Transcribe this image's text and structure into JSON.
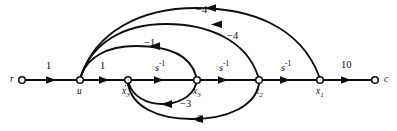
{
  "figure": {
    "type": "signal-flow-graph",
    "title": "",
    "background": "#ffffff",
    "ink_color": "#0d0d0d"
  },
  "nodes": [
    {
      "id": "r",
      "label": "r",
      "sub": "",
      "dot": false,
      "x": 22,
      "y": 80,
      "label_side": "left"
    },
    {
      "id": "u",
      "label": "u",
      "sub": "",
      "dot": false,
      "x": 80,
      "y": 80,
      "label_side": "below"
    },
    {
      "id": "xd3",
      "label": "x",
      "sub": "3",
      "dot": true,
      "x": 128,
      "y": 80,
      "label_side": "below"
    },
    {
      "id": "x3",
      "label": "x",
      "sub": "3",
      "dot": false,
      "x": 197,
      "y": 80,
      "label_side": "below"
    },
    {
      "id": "x2",
      "label": "x",
      "sub": "2",
      "dot": false,
      "x": 259,
      "y": 80,
      "label_side": "below"
    },
    {
      "id": "x1",
      "label": "x",
      "sub": "1",
      "dot": false,
      "x": 320,
      "y": 80,
      "label_side": "below"
    },
    {
      "id": "c",
      "label": "c",
      "sub": "",
      "dot": false,
      "x": 375,
      "y": 80,
      "label_side": "right"
    }
  ],
  "edges": [
    {
      "id": "e-r-u",
      "from": "r",
      "to": "u",
      "gain": "1",
      "kind": "forward",
      "label_x": 46,
      "label_y": 61
    },
    {
      "id": "e-u-xd3",
      "from": "u",
      "to": "xd3",
      "gain": "1",
      "kind": "forward",
      "label_x": 100,
      "label_y": 61
    },
    {
      "id": "e-xd3-x3",
      "from": "xd3",
      "to": "x3",
      "gain": "s",
      "exp": "-1",
      "kind": "forward",
      "label_x": 155,
      "label_y": 61
    },
    {
      "id": "e-x3-x2",
      "from": "x3",
      "to": "x2",
      "gain": "s",
      "exp": "-1",
      "kind": "forward",
      "label_x": 219,
      "label_y": 61
    },
    {
      "id": "e-x2-x1",
      "from": "x2",
      "to": "x1",
      "gain": "s",
      "exp": "-1",
      "kind": "forward",
      "label_x": 281,
      "label_y": 61
    },
    {
      "id": "e-x1-c",
      "from": "x1",
      "to": "c",
      "gain": "10",
      "kind": "forward",
      "label_x": 341,
      "label_y": 61
    },
    {
      "id": "e-x1-u",
      "from": "x1",
      "to": "u",
      "gain": "−4",
      "kind": "feedback-top",
      "label_x": 196,
      "label_y": 6
    },
    {
      "id": "e-x2-u",
      "from": "x2",
      "to": "u",
      "gain": "−4",
      "kind": "feedback-top",
      "label_x": 227,
      "label_y": 33
    },
    {
      "id": "e-x3-u",
      "from": "x3",
      "to": "u",
      "gain": "−1",
      "kind": "feedback-top",
      "label_x": 144,
      "label_y": 40
    },
    {
      "id": "e-x3-xd3",
      "from": "x3",
      "to": "xd3",
      "gain": "−3",
      "kind": "feedback-bottom",
      "label_x": 180,
      "label_y": 99
    },
    {
      "id": "e-x2-xd3",
      "from": "x2",
      "to": "xd3",
      "gain": "−2",
      "kind": "feedback-bottom",
      "label_x": 191,
      "label_y": 114
    }
  ]
}
